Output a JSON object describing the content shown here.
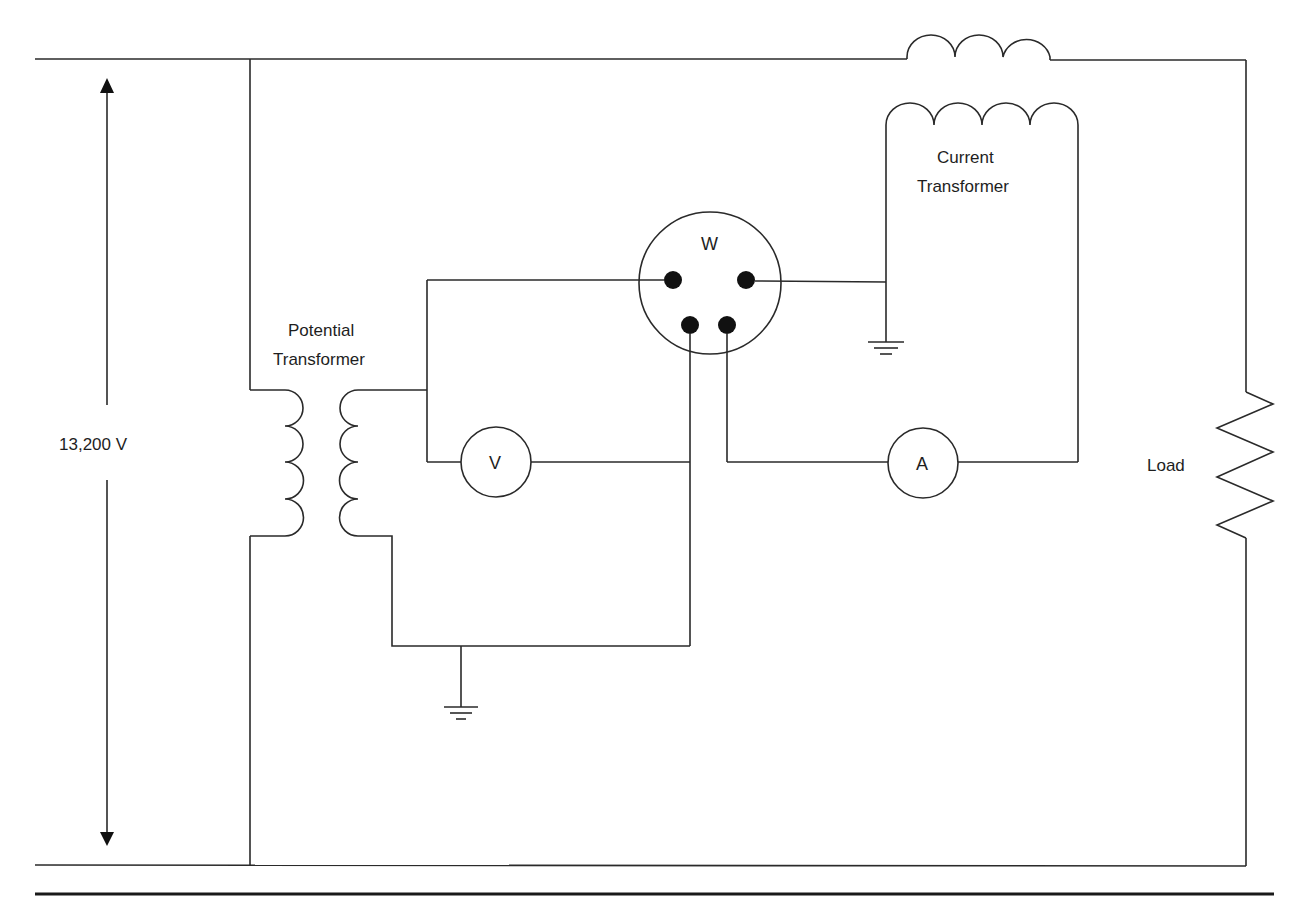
{
  "diagram": {
    "labels": {
      "voltage": "13,200 V",
      "potential_transformer_line1": "Potential",
      "potential_transformer_line2": "Transformer",
      "current_transformer_line1": "Current",
      "current_transformer_line2": "Transformer",
      "load": "Load"
    },
    "meters": {
      "wattmeter": "W",
      "voltmeter": "V",
      "ammeter": "A"
    },
    "components": [
      {
        "id": "supply",
        "type": "voltage-source-indicator",
        "label": "13,200 V"
      },
      {
        "id": "pt",
        "type": "potential-transformer",
        "label": "Potential Transformer",
        "primary_turns_drawn": 4,
        "secondary_turns_drawn": 4
      },
      {
        "id": "ct",
        "type": "current-transformer",
        "label": "Current Transformer",
        "primary_turns_drawn": 3,
        "secondary_turns_drawn": 4
      },
      {
        "id": "wattmeter",
        "type": "meter",
        "label": "W",
        "terminals": 4
      },
      {
        "id": "voltmeter",
        "type": "meter",
        "label": "V"
      },
      {
        "id": "ammeter",
        "type": "meter",
        "label": "A"
      },
      {
        "id": "load",
        "type": "resistor",
        "label": "Load"
      },
      {
        "id": "ground-pt",
        "type": "ground"
      },
      {
        "id": "ground-ct",
        "type": "ground"
      }
    ],
    "colors": {
      "line": "#2a2a2a",
      "terminal": "#111111",
      "background": "#ffffff"
    }
  }
}
